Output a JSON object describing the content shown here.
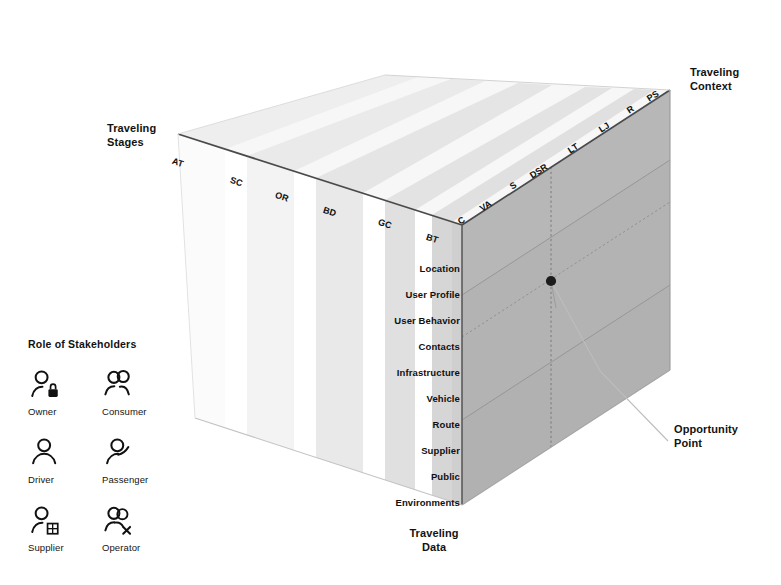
{
  "diagram": {
    "axes": {
      "stages": {
        "title": "Traveling\nStages",
        "ticks": [
          "AT",
          "SC",
          "OR",
          "BD",
          "GC",
          "BT"
        ]
      },
      "context": {
        "title": "Traveling\nContext",
        "ticks": [
          "C",
          "VA",
          "S",
          "DSR",
          "LT",
          "LJ",
          "R",
          "PS"
        ]
      },
      "data": {
        "title": "Traveling\nData",
        "ticks": [
          "Location",
          "User Profile",
          "User Behavior",
          "Contacts",
          "Infrastructure",
          "Vehicle",
          "Route",
          "Supplier",
          "Public",
          "Environments"
        ]
      }
    },
    "annotation": {
      "opportunity_label": "Opportunity\nPoint"
    },
    "legend": {
      "title": "Role of Stakeholders",
      "items": [
        {
          "label": "Owner",
          "icon": "person-lock-icon"
        },
        {
          "label": "Consumer",
          "icon": "two-people-icon"
        },
        {
          "label": "Driver",
          "icon": "person-icon"
        },
        {
          "label": "Passenger",
          "icon": "person-arm-icon"
        },
        {
          "label": "Supplier",
          "icon": "person-grid-icon"
        },
        {
          "label": "Operator",
          "icon": "person-x-icon"
        }
      ]
    },
    "colors": {
      "background": "#ffffff",
      "right_face": "#b3b3b3",
      "slab_darkest": "#c9c9c9",
      "slab_lightest": "#f4f4f4",
      "edge_line": "#4a4a4a",
      "guide_line": "#8d8d8d",
      "point": "#1c1c1c",
      "text": "#121212"
    }
  }
}
